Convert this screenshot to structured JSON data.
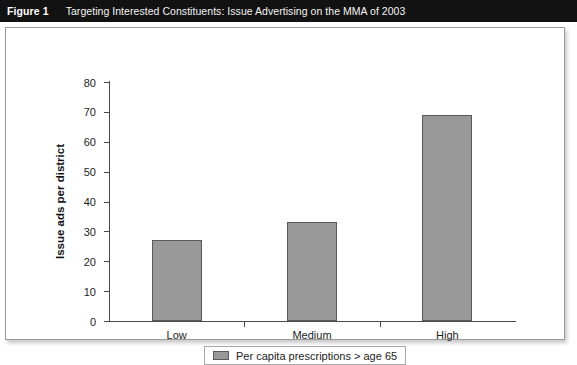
{
  "header": {
    "figure_number": "Figure 1",
    "title": "Targeting Interested Constituents: Issue Advertising on the MMA of 2003",
    "band_color": "#121212"
  },
  "chart_data": {
    "type": "bar",
    "title": "",
    "categories": [
      "Low",
      "Medium",
      "High"
    ],
    "values": [
      27,
      33,
      69
    ],
    "series": [
      {
        "name": "Per capita prescriptions > age 65",
        "values": [
          27,
          33,
          69
        ],
        "color": "#989898"
      }
    ],
    "xlabel": "",
    "ylabel": "Issue ads per district",
    "ylim": [
      0,
      80
    ],
    "yticks": [
      0,
      10,
      20,
      30,
      40,
      50,
      60,
      70,
      80
    ],
    "ytick_labels": [
      "0",
      "10",
      "20",
      "30",
      "40",
      "50",
      "60",
      "70",
      "80"
    ],
    "grid": false,
    "legend_position": "bottom",
    "legend_entries": [
      "Per capita prescriptions > age 65"
    ],
    "bar_fill_color": "#989898",
    "bar_border_color": "#5a5a5a",
    "axis_color": "#4a4a4a",
    "plot_background": "#ffffff"
  },
  "legend": {
    "label": "Per capita prescriptions > age 65"
  }
}
